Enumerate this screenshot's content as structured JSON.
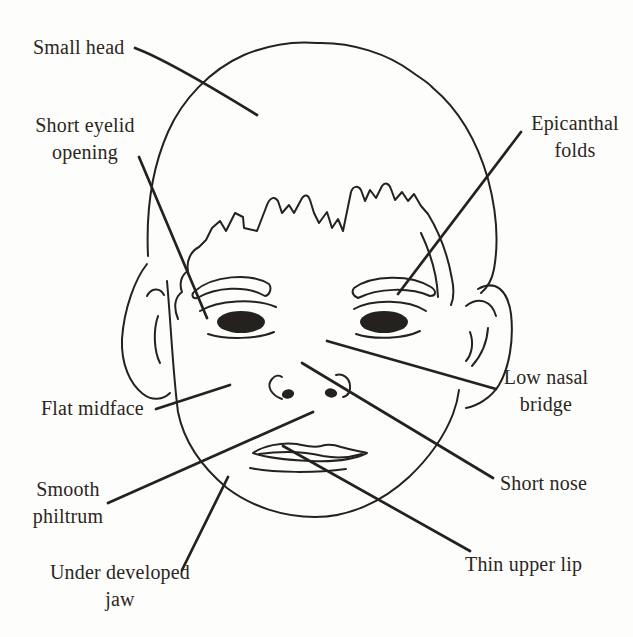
{
  "colors": {
    "ink": "#25211e",
    "label": "#2b2622",
    "background": "#fdfdfb"
  },
  "labels": [
    {
      "id": "small-head",
      "line1": "Small head",
      "line2": ""
    },
    {
      "id": "short-eyelid-opening",
      "line1": "Short eyelid",
      "line2": "opening"
    },
    {
      "id": "epicanthal-folds",
      "line1": "Epicanthal",
      "line2": "folds"
    },
    {
      "id": "flat-midface",
      "line1": "Flat midface",
      "line2": ""
    },
    {
      "id": "low-nasal-bridge",
      "line1": "Low nasal",
      "line2": "bridge"
    },
    {
      "id": "smooth-philtrum",
      "line1": "Smooth",
      "line2": "philtrum"
    },
    {
      "id": "short-nose",
      "line1": "Short nose",
      "line2": ""
    },
    {
      "id": "under-developed-jaw",
      "line1": "Under developed",
      "line2": "jaw"
    },
    {
      "id": "thin-upper-lip",
      "line1": "Thin upper lip",
      "line2": ""
    }
  ]
}
